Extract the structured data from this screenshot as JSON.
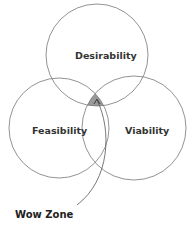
{
  "diagram": {
    "type": "venn",
    "sets": [
      {
        "label": "Desirability",
        "cx": 97,
        "cy": 55,
        "r": 51
      },
      {
        "label": "Feasibility",
        "cx": 59,
        "cy": 128,
        "r": 50
      },
      {
        "label": "Viability",
        "cx": 134,
        "cy": 128,
        "r": 52
      }
    ],
    "intersection_label": "Wow Zone",
    "colors": {
      "stroke": "#777777",
      "highlight": "#999999",
      "text": "#333333"
    }
  }
}
